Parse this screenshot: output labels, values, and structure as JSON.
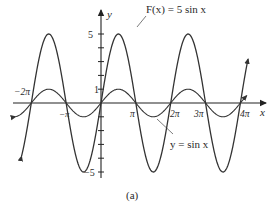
{
  "chart_data": {
    "type": "line",
    "title": "",
    "caption": "(a)",
    "xlabel": "x",
    "ylabel": "y",
    "x_range_radians": [
      -7.0,
      13.6
    ],
    "ylim": [
      -5.5,
      5.8
    ],
    "grid": false,
    "legend": "inline annotations",
    "x_tick_labels": [
      "−2π",
      "−π",
      "π",
      "2π",
      "3π",
      "4π"
    ],
    "x_tick_values_pi": [
      -2,
      -1,
      1,
      2,
      3,
      4
    ],
    "y_tick_labels": [
      "5",
      "1",
      "−5"
    ],
    "y_tick_values": [
      5,
      1,
      -5
    ],
    "y_minor_ticks": [
      1,
      2,
      3,
      4,
      5,
      -1,
      -2,
      -3,
      -4,
      -5
    ],
    "series": [
      {
        "name": "F(x) = 5 sin x",
        "function": "5*sin(x)",
        "amplitude": 5,
        "period": "2π",
        "key_points": [
          {
            "x": "-2π",
            "y": 0
          },
          {
            "x": "-3π/2",
            "y": 5
          },
          {
            "x": "-π",
            "y": 0
          },
          {
            "x": "-π/2",
            "y": -5
          },
          {
            "x": "0",
            "y": 0
          },
          {
            "x": "π/2",
            "y": 5
          },
          {
            "x": "π",
            "y": 0
          },
          {
            "x": "3π/2",
            "y": -5
          },
          {
            "x": "2π",
            "y": 0
          },
          {
            "x": "5π/2",
            "y": 5
          },
          {
            "x": "3π",
            "y": 0
          },
          {
            "x": "7π/2",
            "y": -5
          },
          {
            "x": "4π",
            "y": 0
          }
        ]
      },
      {
        "name": "y = sin x",
        "function": "sin(x)",
        "amplitude": 1,
        "period": "2π",
        "key_points": [
          {
            "x": "-2π",
            "y": 0
          },
          {
            "x": "-3π/2",
            "y": 1
          },
          {
            "x": "-π",
            "y": 0
          },
          {
            "x": "-π/2",
            "y": -1
          },
          {
            "x": "0",
            "y": 0
          },
          {
            "x": "π/2",
            "y": 1
          },
          {
            "x": "π",
            "y": 0
          },
          {
            "x": "3π/2",
            "y": -1
          },
          {
            "x": "2π",
            "y": 0
          },
          {
            "x": "5π/2",
            "y": 1
          },
          {
            "x": "3π",
            "y": 0
          },
          {
            "x": "7π/2",
            "y": -1
          },
          {
            "x": "4π",
            "y": 0
          }
        ]
      }
    ],
    "annotations": [
      {
        "text": "F(x) = 5 sin x",
        "points_to": "peak of 5 sin x at π/2"
      },
      {
        "text": "y = sin x",
        "points_to": "trough of sin x near 3π/2"
      }
    ]
  },
  "labels": {
    "y_axis": "y",
    "x_axis": "x",
    "f_label": "F(x) = 5 sin x",
    "sin_label": "y = sin x",
    "caption": "(a)",
    "xt_m2pi": "−2π",
    "xt_mpi": "−π",
    "xt_pi": "π",
    "xt_2pi": "2π",
    "xt_3pi": "3π",
    "xt_4pi": "4π",
    "yt_5": "5",
    "yt_1": "1",
    "yt_m5": "−5"
  },
  "style": {
    "line_color": "#333333",
    "axis_color": "#222222",
    "background": "#ffffff"
  }
}
